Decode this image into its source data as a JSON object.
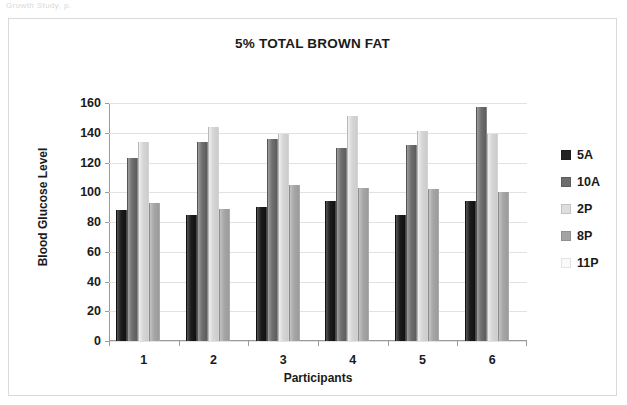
{
  "scan": {
    "top_fragment": "Growth Study, p."
  },
  "chart_data": {
    "type": "bar",
    "title": "5% TOTAL BROWN FAT",
    "xlabel": "Participants",
    "ylabel": "Blood Glucose Level",
    "categories": [
      "1",
      "2",
      "3",
      "4",
      "5",
      "6"
    ],
    "ylim": [
      0,
      160
    ],
    "ytick_labels": [
      "0",
      "20",
      "40",
      "60",
      "80",
      "100",
      "120",
      "140",
      "160"
    ],
    "ytick_values": [
      0,
      20,
      40,
      60,
      80,
      100,
      120,
      140,
      160
    ],
    "grid": true,
    "legend_position": "right",
    "series": [
      {
        "name": "5A",
        "color": "#1c1c1c",
        "values": [
          88,
          85,
          90,
          94,
          85,
          94
        ]
      },
      {
        "name": "10A",
        "color": "#6d6d6d",
        "values": [
          123,
          134,
          136,
          130,
          132,
          157
        ]
      },
      {
        "name": "2P",
        "color": "#dedede",
        "values": [
          134,
          144,
          139,
          151,
          141,
          139
        ]
      },
      {
        "name": "8P",
        "color": "#a3a3a3",
        "values": [
          93,
          89,
          105,
          103,
          102,
          100
        ]
      },
      {
        "name": "11P",
        "color": "#fafafa",
        "values": [
          0,
          0,
          0,
          0,
          0,
          0
        ]
      }
    ]
  },
  "legend": {
    "items": [
      {
        "label": "5A"
      },
      {
        "label": "10A"
      },
      {
        "label": "2P"
      },
      {
        "label": "8P"
      },
      {
        "label": "11P"
      }
    ]
  }
}
